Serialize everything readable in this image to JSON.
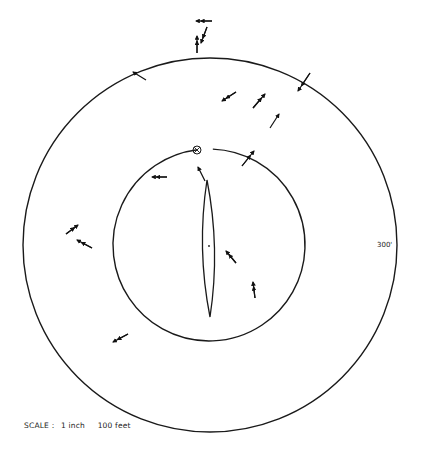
{
  "diagram": {
    "title": "",
    "outer_circle": {
      "cx": 210,
      "cy": 245,
      "r": 187
    },
    "inner_circle": {
      "cx": 209,
      "cy": 245,
      "r": 96,
      "gap_at_top": true
    },
    "lens": {
      "top": [
        207,
        180
      ],
      "bottom": [
        210,
        317
      ],
      "half_width": 6,
      "center_dot": [
        209,
        246
      ]
    },
    "origin_marker": {
      "symbol": "circle-cross",
      "x": 197,
      "y": 150,
      "r": 4
    },
    "radius_label": "300'",
    "scale": {
      "prefix": "SCALE :",
      "inch": "1 inch",
      "feet": "100 feet"
    },
    "arrows": [
      {
        "id": "a1",
        "x1": 212,
        "y1": 21,
        "x2": 196,
        "y2": 21,
        "double_head": true
      },
      {
        "id": "a2",
        "x1": 197,
        "y1": 53,
        "x2": 197,
        "y2": 36,
        "double_head": true
      },
      {
        "id": "a3",
        "x1": 207,
        "y1": 27,
        "x2": 201,
        "y2": 43,
        "double_head": true
      },
      {
        "id": "a4",
        "x1": 146,
        "y1": 80,
        "x2": 133,
        "y2": 72,
        "double_head": false
      },
      {
        "id": "a5",
        "x1": 310,
        "y1": 73,
        "x2": 298,
        "y2": 91,
        "double_head": true
      },
      {
        "id": "a6",
        "x1": 236,
        "y1": 92,
        "x2": 222,
        "y2": 101,
        "double_head": true
      },
      {
        "id": "a7",
        "x1": 253,
        "y1": 108,
        "x2": 265,
        "y2": 94,
        "double_head": true
      },
      {
        "id": "a8",
        "x1": 270,
        "y1": 128,
        "x2": 279,
        "y2": 114,
        "double_head": false
      },
      {
        "id": "a9",
        "x1": 242,
        "y1": 166,
        "x2": 254,
        "y2": 151,
        "double_head": true
      },
      {
        "id": "a10",
        "x1": 167,
        "y1": 177,
        "x2": 152,
        "y2": 177,
        "double_head": true
      },
      {
        "id": "a11",
        "x1": 205,
        "y1": 181,
        "x2": 198,
        "y2": 167,
        "double_head": false
      },
      {
        "id": "a12",
        "x1": 66,
        "y1": 234,
        "x2": 78,
        "y2": 225,
        "double_head": true
      },
      {
        "id": "a13",
        "x1": 92,
        "y1": 248,
        "x2": 77,
        "y2": 240,
        "double_head": true
      },
      {
        "id": "a14",
        "x1": 236,
        "y1": 263,
        "x2": 226,
        "y2": 251,
        "double_head": true
      },
      {
        "id": "a15",
        "x1": 255,
        "y1": 298,
        "x2": 253,
        "y2": 282,
        "double_head": true
      },
      {
        "id": "a16",
        "x1": 128,
        "y1": 334,
        "x2": 113,
        "y2": 342,
        "double_head": true
      }
    ]
  }
}
